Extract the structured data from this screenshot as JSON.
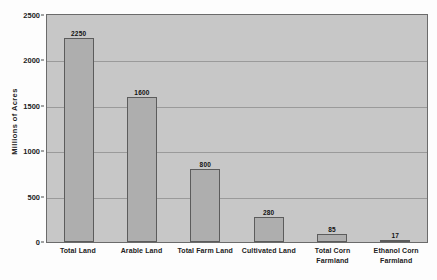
{
  "chart_data": {
    "type": "bar",
    "title": "",
    "xlabel": "",
    "ylabel": "Millions of Acres",
    "categories": [
      "Total Land",
      "Arable Land",
      "Total Farm Land",
      "Cultivated Land",
      "Total Corn Farmland",
      "Ethanol Corn Farmland"
    ],
    "category_lines": [
      [
        "Total Land"
      ],
      [
        "Arable Land"
      ],
      [
        "Total Farm Land"
      ],
      [
        "Cultivated Land"
      ],
      [
        "Total Corn",
        "Farmland"
      ],
      [
        "Ethanol Corn",
        "Farmland"
      ]
    ],
    "values": [
      2250,
      1600,
      800,
      280,
      85,
      17
    ],
    "data_labels": [
      "2250",
      "1600",
      "800",
      "280",
      "85",
      "17"
    ],
    "ylim": [
      0,
      2500
    ],
    "yticks": [
      0,
      500,
      1000,
      1500,
      2000,
      2500
    ],
    "ytick_labels": [
      "0",
      "500",
      "1000",
      "1500",
      "2000",
      "2500"
    ],
    "grid": true,
    "grid_axis": "y",
    "legend": false,
    "legend_position": "none",
    "units": "millions of acres"
  },
  "style": {
    "plot_background": "#c7c7c7",
    "bar_fill": "#aeaeae",
    "bar_border": "#5c5c5c",
    "gridline_color": "#9a9a9a",
    "axis_color": "#6b6b6b",
    "text_color": "#222222",
    "figure_background": "#fdfdfd"
  }
}
